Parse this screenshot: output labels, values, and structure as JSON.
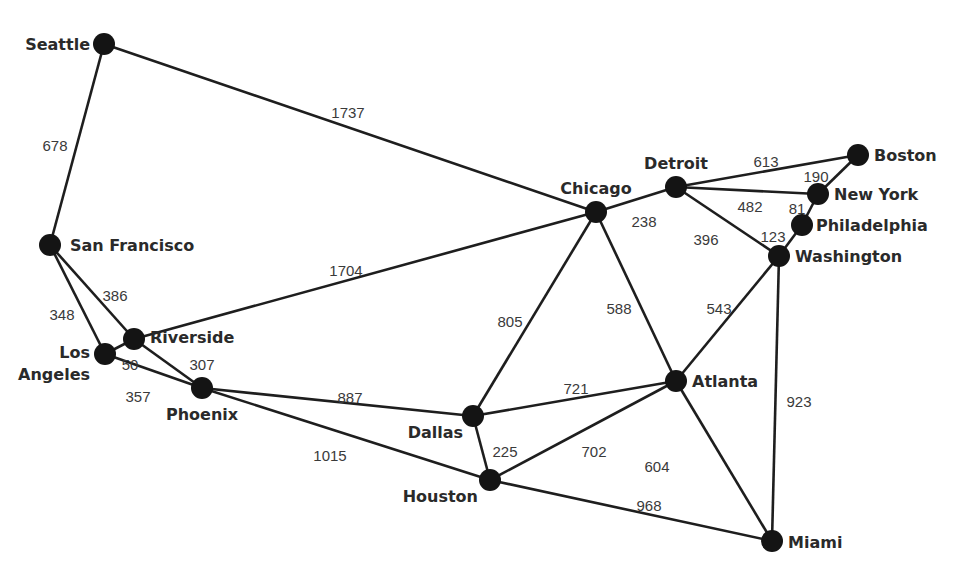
{
  "nodes": [
    {
      "id": "seattle",
      "label": "Seattle"
    },
    {
      "id": "san-francisco",
      "label": "San Francisco"
    },
    {
      "id": "los-angeles",
      "label": "Los Angeles",
      "label_lines": [
        "Los",
        "Angeles"
      ]
    },
    {
      "id": "riverside",
      "label": "Riverside"
    },
    {
      "id": "phoenix",
      "label": "Phoenix"
    },
    {
      "id": "chicago",
      "label": "Chicago"
    },
    {
      "id": "detroit",
      "label": "Detroit"
    },
    {
      "id": "boston",
      "label": "Boston"
    },
    {
      "id": "new-york",
      "label": "New York"
    },
    {
      "id": "philadelphia",
      "label": "Philadelphia"
    },
    {
      "id": "washington",
      "label": "Washington"
    },
    {
      "id": "atlanta",
      "label": "Atlanta"
    },
    {
      "id": "dallas",
      "label": "Dallas"
    },
    {
      "id": "houston",
      "label": "Houston"
    },
    {
      "id": "miami",
      "label": "Miami"
    }
  ],
  "edges": [
    {
      "from": "seattle",
      "to": "chicago",
      "distance": "1737"
    },
    {
      "from": "seattle",
      "to": "san-francisco",
      "distance": "678"
    },
    {
      "from": "san-francisco",
      "to": "los-angeles",
      "distance": "348"
    },
    {
      "from": "san-francisco",
      "to": "riverside",
      "distance": "386"
    },
    {
      "from": "los-angeles",
      "to": "riverside",
      "distance": "50"
    },
    {
      "from": "los-angeles",
      "to": "phoenix",
      "distance": "357"
    },
    {
      "from": "riverside",
      "to": "phoenix",
      "distance": "307"
    },
    {
      "from": "riverside",
      "to": "chicago",
      "distance": "1704"
    },
    {
      "from": "phoenix",
      "to": "dallas",
      "distance": "887"
    },
    {
      "from": "phoenix",
      "to": "houston",
      "distance": "1015"
    },
    {
      "from": "chicago",
      "to": "detroit",
      "distance": "238"
    },
    {
      "from": "chicago",
      "to": "dallas",
      "distance": "805"
    },
    {
      "from": "chicago",
      "to": "atlanta",
      "distance": "588"
    },
    {
      "from": "detroit",
      "to": "boston",
      "distance": "613"
    },
    {
      "from": "detroit",
      "to": "new-york",
      "distance": "482"
    },
    {
      "from": "detroit",
      "to": "washington",
      "distance": "396"
    },
    {
      "from": "boston",
      "to": "new-york",
      "distance": "190"
    },
    {
      "from": "new-york",
      "to": "philadelphia",
      "distance": "81"
    },
    {
      "from": "philadelphia",
      "to": "washington",
      "distance": "123"
    },
    {
      "from": "washington",
      "to": "atlanta",
      "distance": "543"
    },
    {
      "from": "washington",
      "to": "miami",
      "distance": "923"
    },
    {
      "from": "dallas",
      "to": "atlanta",
      "distance": "721"
    },
    {
      "from": "dallas",
      "to": "houston",
      "distance": "225"
    },
    {
      "from": "houston",
      "to": "atlanta",
      "distance": "702"
    },
    {
      "from": "houston",
      "to": "miami",
      "distance": "968"
    },
    {
      "from": "atlanta",
      "to": "miami",
      "distance": "604"
    }
  ]
}
